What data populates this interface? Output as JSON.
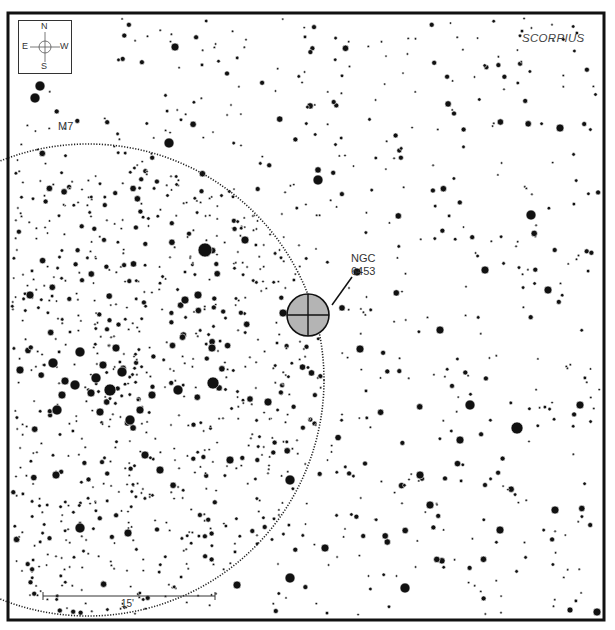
{
  "chart": {
    "frame": {
      "x": 8,
      "y": 13,
      "width": 596,
      "height": 607,
      "stroke": "#111111",
      "stroke_width": 3
    },
    "constellation_label": "SCORPIUS",
    "compass": {
      "north": "N",
      "south": "S",
      "east": "E",
      "west": "W"
    },
    "scale_bar": {
      "label": "15'",
      "x1": 43,
      "x2": 215,
      "y": 596
    },
    "objects": [
      {
        "id": "m7",
        "label": "M7",
        "type": "open-cluster-outline",
        "cx": 88,
        "cy": 380,
        "r": 236,
        "label_x": 58,
        "label_y": 126
      },
      {
        "id": "ngc6453",
        "label_line1": "NGC",
        "label_line2": "6453",
        "type": "globular-cluster",
        "cx": 308,
        "cy": 315,
        "r": 21,
        "fill": "#b4b4b4",
        "label_x": 351,
        "label_y": 253,
        "leader": [
          332,
          305,
          352,
          277
        ]
      }
    ],
    "bright_stars": [
      [
        205,
        250,
        7
      ],
      [
        213,
        383,
        6
      ],
      [
        53,
        363,
        5
      ],
      [
        57,
        410,
        5
      ],
      [
        110,
        390,
        6
      ],
      [
        122,
        372,
        5
      ],
      [
        80,
        352,
        5
      ],
      [
        130,
        420,
        5
      ],
      [
        91,
        393,
        4
      ],
      [
        75,
        385,
        5
      ],
      [
        318,
        180,
        5
      ],
      [
        531,
        215,
        5
      ],
      [
        517,
        428,
        6
      ],
      [
        470,
        405,
        5
      ],
      [
        405,
        588,
        5
      ],
      [
        290,
        578,
        5
      ],
      [
        237,
        585,
        4
      ],
      [
        80,
        528,
        5
      ],
      [
        290,
        480,
        5
      ],
      [
        268,
        402,
        4
      ],
      [
        169,
        143,
        5
      ],
      [
        360,
        349,
        4
      ],
      [
        283,
        313,
        4
      ],
      [
        357,
        272,
        4
      ],
      [
        548,
        290,
        4
      ],
      [
        560,
        128,
        4
      ],
      [
        175,
        47,
        4
      ],
      [
        40,
        86,
        5
      ],
      [
        35,
        98,
        5
      ],
      [
        128,
        533,
        4
      ],
      [
        440,
        330,
        4
      ],
      [
        178,
        390,
        5
      ],
      [
        116,
        348,
        4
      ],
      [
        96,
        378,
        5
      ],
      [
        62,
        395,
        4
      ],
      [
        65,
        381,
        4
      ],
      [
        103,
        365,
        4
      ],
      [
        100,
        412,
        4
      ],
      [
        152,
        395,
        4
      ],
      [
        140,
        410,
        4
      ],
      [
        56,
        475,
        4
      ],
      [
        160,
        470,
        4
      ],
      [
        230,
        460,
        4
      ],
      [
        460,
        440,
        4
      ],
      [
        500,
        530,
        4
      ],
      [
        555,
        510,
        4
      ],
      [
        597,
        612,
        4
      ],
      [
        30,
        295,
        4
      ],
      [
        570,
        610,
        3
      ],
      [
        430,
        505,
        4
      ],
      [
        245,
        240,
        4
      ],
      [
        145,
        455,
        4
      ],
      [
        185,
        300,
        4
      ],
      [
        212,
        348,
        4
      ],
      [
        20,
        370,
        4
      ],
      [
        325,
        548,
        4
      ],
      [
        198,
        295,
        4
      ],
      [
        420,
        475,
        4
      ],
      [
        485,
        270,
        4
      ],
      [
        580,
        405,
        4
      ]
    ],
    "field": {
      "seed": 6453,
      "count_outside": 720,
      "count_inside_m7": 520
    }
  }
}
